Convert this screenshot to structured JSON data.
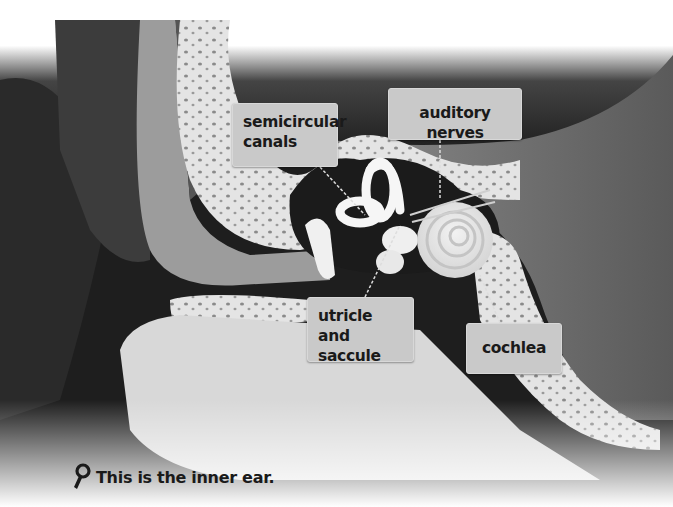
{
  "illustration": {
    "subject": "inner ear cross-section",
    "colors": {
      "background_top": "#ffffff",
      "dark_cavity": "#1a1a1a",
      "tissue_gray": "#6e6e6e",
      "bone": "#e6e6e6",
      "label_bg": "#c9c9c9",
      "leader_line": "#dddddd"
    }
  },
  "labels": [
    {
      "id": "semicircular-canals",
      "text_line1": "semicircular",
      "text_line2": "canals"
    },
    {
      "id": "auditory-nerves",
      "text_line1": "auditory nerves"
    },
    {
      "id": "utricle-and-saccule",
      "text_line1": "utricle and",
      "text_line2": "saccule"
    },
    {
      "id": "cochlea",
      "text_line1": "cochlea"
    }
  ],
  "caption": {
    "icon": "magnifier-icon",
    "text": "This is the inner ear."
  }
}
